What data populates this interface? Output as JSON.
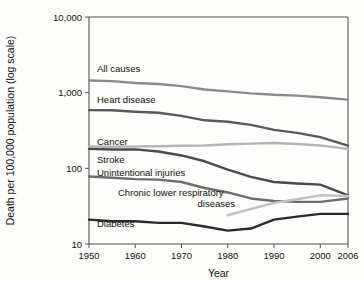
{
  "chart_data": {
    "type": "line",
    "title": "",
    "xlabel": "Year",
    "ylabel": "Death per 100,000 population (log scale)",
    "yscale": "log",
    "ylim": [
      10,
      10000
    ],
    "xlim": [
      1950,
      2006
    ],
    "grid": false,
    "legend_position": "inline-labels",
    "ytick_labels": [
      "10,000",
      "1,000",
      "100",
      "10"
    ],
    "ytick_values": [
      10000,
      1000,
      100,
      10
    ],
    "xtick_labels": [
      "1950",
      "1960",
      "1970",
      "1980",
      "1990",
      "2000",
      "2006"
    ],
    "xtick_values": [
      1950,
      1960,
      1970,
      1980,
      1990,
      2000,
      2006
    ],
    "x": [
      1950,
      1955,
      1960,
      1965,
      1970,
      1975,
      1980,
      1985,
      1990,
      1995,
      2000,
      2006
    ],
    "series": [
      {
        "name": "All causes",
        "color": "#8a8a8a",
        "label": "All causes",
        "values": [
          1446,
          1420,
          1339,
          1302,
          1222,
          1100,
          1039,
          980,
          939,
          915,
          869,
          810
        ]
      },
      {
        "name": "Heart disease",
        "color": "#5a5a5a",
        "label": "Heart disease",
        "values": [
          587,
          585,
          559,
          542,
          493,
          431,
          412,
          375,
          322,
          294,
          258,
          200
        ]
      },
      {
        "name": "Cancer",
        "color": "#b5b5b5",
        "label": "Cancer",
        "values": [
          194,
          193,
          194,
          196,
          199,
          200,
          208,
          212,
          216,
          210,
          200,
          181
        ]
      },
      {
        "name": "Stroke",
        "color": "#4a4a4a",
        "label": "Stroke",
        "values": [
          181,
          177,
          178,
          167,
          148,
          124,
          96,
          77,
          66,
          63,
          61,
          44
        ]
      },
      {
        "name": "Unintentional injuries",
        "color": "#6d6d6d",
        "label": "Unintentional injuries",
        "values": [
          78,
          75,
          72,
          71,
          66,
          55,
          48,
          40,
          37,
          36,
          36,
          40
        ]
      },
      {
        "name": "Chronic lower respiratory diseases",
        "color": "#c2c2c2",
        "label": "Chronic lower respiratory diseases",
        "label_line1": "Chronic lower respiratory",
        "label_line2": "diseases",
        "values": [
          null,
          null,
          null,
          null,
          null,
          null,
          24,
          29,
          35,
          39,
          44,
          43
        ]
      },
      {
        "name": "Diabetes",
        "color": "#2b2b2b",
        "label": "Diabetes",
        "values": [
          21,
          20,
          20,
          19,
          19,
          17,
          15,
          16,
          21,
          23,
          25,
          25
        ]
      }
    ]
  },
  "axis": {
    "y_title": "Death per 100,000 population (log scale)",
    "x_title": "Year"
  }
}
